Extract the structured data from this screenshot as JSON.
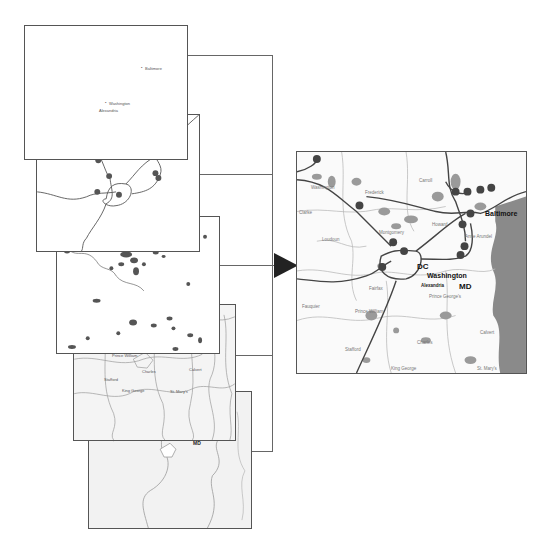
{
  "diagram": {
    "type": "map-layer-composition",
    "arrow": {
      "direction": "right",
      "color": "#222222"
    },
    "layers": [
      {
        "id": "cities",
        "name": "City points layer",
        "labels": [
          "Baltimore",
          "Washington",
          "Alexandria"
        ]
      },
      {
        "id": "highways",
        "name": "Interstate highways layer",
        "labels": []
      },
      {
        "id": "urban-areas",
        "name": "Urban areas layer",
        "labels": []
      },
      {
        "id": "counties",
        "name": "County boundaries layer",
        "labels": [
          "Montgomery",
          "Loudoun",
          "Fairfax",
          "Prince George's",
          "Anne Arundel",
          "Fauquier",
          "Prince William",
          "Charles",
          "Calvert",
          "Stafford",
          "King George",
          "St. Mary's",
          "Kent",
          "Talbot",
          "Dorchester"
        ]
      },
      {
        "id": "states",
        "name": "State boundaries layer",
        "labels": [
          "DC",
          "MD"
        ]
      }
    ],
    "composite": {
      "name": "Composite map",
      "city_labels": [
        "DC",
        "Washington",
        "Baltimore",
        "MD",
        "Alexandria"
      ],
      "county_labels": [
        "Washington",
        "Frederick",
        "Carroll",
        "Howard",
        "Clarke",
        "Loudoun",
        "Montgomery",
        "Anne Arundel",
        "Fairfax",
        "Prince George's",
        "Fauquier",
        "Prince William",
        "Charles",
        "Calvert",
        "Stafford",
        "King George",
        "St. Mary's"
      ],
      "colors": {
        "water": "#8a8a8a",
        "urban": "#9a9a9a",
        "road": "#444444",
        "boundary": "#bbbbbb",
        "shield": "#444444"
      }
    }
  }
}
